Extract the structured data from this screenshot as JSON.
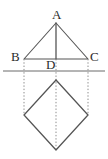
{
  "figure": {
    "background_color": "#ffffff",
    "stroke_color": "#555555",
    "guide_color": "#8c8c8c",
    "label_color": "#2b2b2b",
    "canvas": {
      "width": 108,
      "height": 159
    },
    "labels": {
      "apex": "A",
      "base_left": "B",
      "base_right": "C",
      "foot": "D"
    },
    "points": {
      "A": {
        "x": 56,
        "y": 23
      },
      "B": {
        "x": 24,
        "y": 59
      },
      "C": {
        "x": 88,
        "y": 59
      },
      "D": {
        "x": 56,
        "y": 59
      },
      "square_top": {
        "x": 56,
        "y": 80
      },
      "square_left": {
        "x": 24,
        "y": 115
      },
      "square_right": {
        "x": 88,
        "y": 115
      },
      "square_bottom": {
        "x": 56,
        "y": 150
      }
    },
    "mirror_line": {
      "x1": 3,
      "y1": 71,
      "x2": 105,
      "y2": 71
    },
    "guides": [
      {
        "name": "left-guide",
        "x": 24,
        "y1": 59,
        "y2": 115
      },
      {
        "name": "center-guide",
        "x": 56,
        "y1": 59,
        "y2": 150
      },
      {
        "name": "right-guide",
        "x": 88,
        "y1": 59,
        "y2": 115
      }
    ]
  }
}
